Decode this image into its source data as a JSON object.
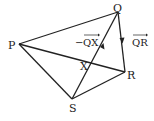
{
  "diagram": {
    "points": {
      "P": {
        "label": "P",
        "x": 19,
        "y": 44
      },
      "Q": {
        "label": "Q",
        "x": 118,
        "y": 12
      },
      "R": {
        "label": "R",
        "x": 125,
        "y": 72
      },
      "S": {
        "label": "S",
        "x": 72,
        "y": 99
      },
      "X": {
        "label": "X",
        "x": 92,
        "y": 63
      }
    },
    "segments": [
      [
        "P",
        "Q"
      ],
      [
        "P",
        "R"
      ],
      [
        "P",
        "S"
      ],
      [
        "Q",
        "R"
      ],
      [
        "S",
        "R"
      ],
      [
        "S",
        "Q"
      ]
    ],
    "vector_labels": {
      "neg_QX": {
        "minus": "−",
        "text": "QX"
      },
      "QR": {
        "text": "QR"
      }
    },
    "line_color": "#222222"
  }
}
